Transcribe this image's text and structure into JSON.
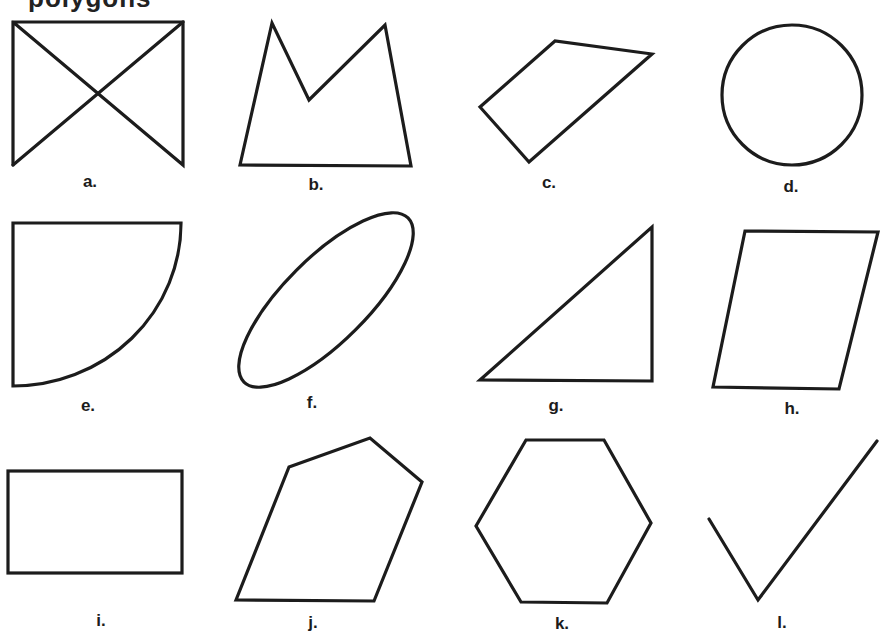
{
  "heading_fragment": "polygons",
  "stroke_color": "#1c1c1c",
  "figures": [
    {
      "id": "a",
      "label": "a.",
      "kind": "bowtie",
      "description": "Rectangle sides and top with crossing diagonals, no bottom edge"
    },
    {
      "id": "b",
      "label": "b.",
      "kind": "concave-polygon",
      "description": "Pentagon with a notch (M-shaped top)"
    },
    {
      "id": "c",
      "label": "c.",
      "kind": "quadrilateral",
      "description": "Irregular quadrilateral"
    },
    {
      "id": "d",
      "label": "d.",
      "kind": "circle",
      "description": "Circle"
    },
    {
      "id": "e",
      "label": "e.",
      "kind": "quarter-circle",
      "description": "Quarter circle sector"
    },
    {
      "id": "f",
      "label": "f.",
      "kind": "ellipse",
      "description": "Tilted ellipse"
    },
    {
      "id": "g",
      "label": "g.",
      "kind": "right-triangle",
      "description": "Right triangle"
    },
    {
      "id": "h",
      "label": "h.",
      "kind": "parallelogram",
      "description": "Parallelogram"
    },
    {
      "id": "i",
      "label": "i.",
      "kind": "rectangle",
      "description": "Rectangle"
    },
    {
      "id": "j",
      "label": "j.",
      "kind": "pentagon",
      "description": "Irregular convex pentagon"
    },
    {
      "id": "k",
      "label": "k.",
      "kind": "hexagon",
      "description": "Hexagon"
    },
    {
      "id": "l",
      "label": "l.",
      "kind": "open-polyline",
      "description": "Check-mark shape (open, two segments)"
    }
  ]
}
